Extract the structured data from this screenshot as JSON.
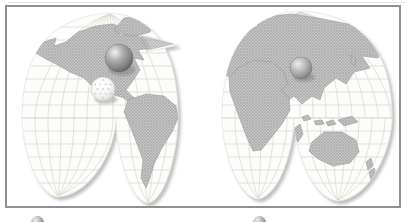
{
  "window": {
    "background_color": "#ffffff"
  },
  "map": {
    "projection": "interrupted-goode-homolosine",
    "colors": {
      "frame_border": "#909090",
      "ocean": "#fcfcfa",
      "graticule": "#d8d5cc",
      "land_base": "#c6c6c6",
      "land_dot": "#8d8d8d",
      "land_outline": "#9b9b9b",
      "lobe_shadow": "#8a8a8a"
    },
    "continents": [
      "north-america",
      "greenland",
      "south-america",
      "eurasia",
      "africa",
      "madagascar",
      "australia",
      "new-guinea",
      "indonesia",
      "new-zealand",
      "japan",
      "united-kingdom"
    ],
    "markers": [
      {
        "name": "sphere-marker-north-america",
        "shape": "sphere",
        "variant": "dark",
        "color": "#8f8f8f",
        "location": "central-canada",
        "x": 119,
        "y": 58,
        "r": 14
      },
      {
        "name": "golf-ball-marker-north-america",
        "shape": "golf-ball",
        "variant": "light",
        "color": "#ffffff",
        "location": "southwest-united-states",
        "x": 103,
        "y": 89,
        "r": 12
      },
      {
        "name": "sphere-marker-east-asia",
        "shape": "sphere",
        "variant": "light",
        "color": "#a5a5a5",
        "location": "eastern-china",
        "x": 301,
        "y": 68,
        "r": 11
      }
    ]
  },
  "legend": {
    "items": [
      {
        "icon": "sphere-icon",
        "label": "",
        "x": 31
      },
      {
        "icon": "sphere-icon",
        "label": "",
        "x": 253
      }
    ]
  }
}
